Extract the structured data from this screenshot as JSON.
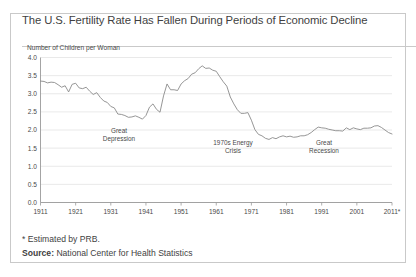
{
  "title": "The U.S. Fertility Rate Has Fallen During Periods of Economic Decline",
  "axis_title": "Number of Children per Woman",
  "footnote": "* Estimated by PRB.",
  "source": {
    "label": "Source:",
    "text": " National Center for Health Statistics"
  },
  "annotations": {
    "depression": {
      "line1": "Great",
      "line2": "Depression"
    },
    "energy": {
      "line1": "1970s Energy",
      "line2": "Crisis"
    },
    "recession": {
      "line1": "Great",
      "line2": "Recession"
    }
  },
  "colors": {
    "line": "#8a8a8a",
    "grid": "#e3e3e3",
    "axis": "#9a9a9a",
    "border": "#c9c9c9",
    "text": "#3f3f3f"
  },
  "chart_data": {
    "type": "line",
    "title": "The U.S. Fertility Rate Has Fallen During Periods of Economic Decline",
    "xlabel": "",
    "ylabel": "Number of Children per Woman",
    "ylim": [
      0.0,
      4.0
    ],
    "xlim": [
      1911,
      2011
    ],
    "grid": true,
    "legend": "none",
    "ytick_labels": [
      "0.0",
      "0.5",
      "1.0",
      "1.5",
      "2.0",
      "2.5",
      "3.0",
      "3.5",
      "4.0"
    ],
    "ytick_values": [
      0.0,
      0.5,
      1.0,
      1.5,
      2.0,
      2.5,
      3.0,
      3.5,
      4.0
    ],
    "xtick_labels": [
      "1911",
      "1921",
      "1931",
      "1941",
      "1951",
      "1961",
      "1971",
      "1981",
      "1991",
      "2001",
      "2011*"
    ],
    "xtick_values": [
      1911,
      1921,
      1931,
      1941,
      1951,
      1961,
      1971,
      1981,
      1991,
      2001,
      2011
    ],
    "series": [
      {
        "name": "U.S. Total Fertility Rate",
        "x": [
          1911,
          1912,
          1913,
          1914,
          1915,
          1916,
          1917,
          1918,
          1919,
          1920,
          1921,
          1922,
          1923,
          1924,
          1925,
          1926,
          1927,
          1928,
          1929,
          1930,
          1931,
          1932,
          1933,
          1934,
          1935,
          1936,
          1937,
          1938,
          1939,
          1940,
          1941,
          1942,
          1943,
          1944,
          1945,
          1946,
          1947,
          1948,
          1949,
          1950,
          1951,
          1952,
          1953,
          1954,
          1955,
          1956,
          1957,
          1958,
          1959,
          1960,
          1961,
          1962,
          1963,
          1964,
          1965,
          1966,
          1967,
          1968,
          1969,
          1970,
          1971,
          1972,
          1973,
          1974,
          1975,
          1976,
          1977,
          1978,
          1979,
          1980,
          1981,
          1982,
          1983,
          1984,
          1985,
          1986,
          1987,
          1988,
          1989,
          1990,
          1991,
          1992,
          1993,
          1994,
          1995,
          1996,
          1997,
          1998,
          1999,
          2000,
          2001,
          2002,
          2003,
          2004,
          2005,
          2006,
          2007,
          2008,
          2009,
          2010,
          2011
        ],
        "y": [
          3.35,
          3.34,
          3.3,
          3.32,
          3.31,
          3.25,
          3.18,
          3.22,
          3.05,
          3.26,
          3.29,
          3.16,
          3.14,
          3.18,
          3.07,
          2.98,
          3.03,
          2.9,
          2.8,
          2.76,
          2.65,
          2.61,
          2.44,
          2.43,
          2.4,
          2.35,
          2.36,
          2.39,
          2.35,
          2.3,
          2.4,
          2.63,
          2.72,
          2.57,
          2.49,
          2.94,
          3.27,
          3.11,
          3.11,
          3.09,
          3.27,
          3.36,
          3.42,
          3.54,
          3.58,
          3.69,
          3.77,
          3.7,
          3.71,
          3.65,
          3.62,
          3.47,
          3.33,
          3.21,
          2.91,
          2.72,
          2.56,
          2.46,
          2.46,
          2.48,
          2.27,
          2.01,
          1.88,
          1.84,
          1.77,
          1.74,
          1.79,
          1.76,
          1.81,
          1.84,
          1.81,
          1.83,
          1.8,
          1.81,
          1.84,
          1.84,
          1.87,
          1.93,
          2.01,
          2.08,
          2.06,
          2.05,
          2.02,
          2.0,
          1.98,
          1.98,
          1.97,
          2.06,
          2.01,
          2.06,
          2.03,
          2.01,
          2.05,
          2.05,
          2.06,
          2.11,
          2.12,
          2.07,
          2.0,
          1.93,
          1.89
        ]
      }
    ],
    "annotations": [
      {
        "text": "Great Depression",
        "x": 1934,
        "y": 1.62
      },
      {
        "text": "1970s Energy Crisis",
        "x": 1975,
        "y": 1.37
      },
      {
        "text": "Great Recession",
        "x": 2003,
        "y": 1.37
      }
    ]
  }
}
